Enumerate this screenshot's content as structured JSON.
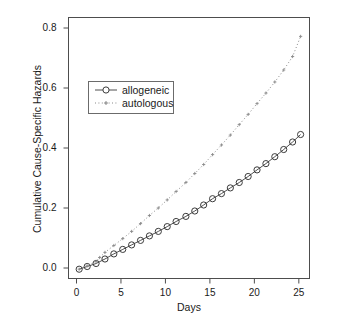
{
  "chart_data": {
    "type": "line",
    "title": "",
    "xlabel": "Days",
    "ylabel": "Cumulative Cause-Specific Hazards",
    "xlim": [
      -0.9,
      26.2
    ],
    "ylim": [
      -0.035,
      0.835
    ],
    "xticks": [
      0,
      5,
      10,
      15,
      20,
      25
    ],
    "xticklabels": [
      "0",
      "5",
      "10",
      "15",
      "20",
      "25"
    ],
    "yticks": [
      0.0,
      0.2,
      0.4,
      0.6,
      0.8
    ],
    "yticklabels": [
      "0.0",
      "0.2",
      "0.4",
      "0.6",
      "0.8"
    ],
    "grid": false,
    "legend_position": "upper-left-inset",
    "series": [
      {
        "name": "allogeneic",
        "marker": "open-circle",
        "linestyle": "solid",
        "color": "#3b3b3b",
        "x": [
          0.3,
          1.2,
          2.2,
          3.2,
          4.2,
          5.2,
          6.2,
          7.2,
          8.2,
          9.2,
          10.2,
          11.2,
          12.3,
          13.3,
          14.3,
          15.3,
          16.3,
          17.3,
          18.3,
          19.3,
          20.3,
          21.3,
          22.3,
          23.3,
          24.3,
          25.2
        ],
        "y": [
          -0.004,
          0.005,
          0.015,
          0.03,
          0.047,
          0.062,
          0.077,
          0.092,
          0.107,
          0.122,
          0.138,
          0.155,
          0.172,
          0.19,
          0.21,
          0.231,
          0.248,
          0.267,
          0.285,
          0.305,
          0.327,
          0.348,
          0.371,
          0.395,
          0.42,
          0.445
        ]
      },
      {
        "name": "autologous",
        "marker": "dot-plus",
        "linestyle": "dotted",
        "color": "#8a8a8a",
        "x": [
          0.3,
          1.2,
          2.2,
          2.6,
          3.2,
          4.2,
          5.2,
          6.2,
          7.2,
          8.2,
          9.2,
          10.2,
          11.2,
          12.3,
          13.3,
          14.3,
          15.3,
          16.3,
          17.3,
          18.3,
          19.3,
          20.3,
          21.3,
          22.3,
          23.3,
          24.3,
          25.2
        ],
        "y": [
          -0.004,
          0.007,
          0.022,
          0.035,
          0.052,
          0.075,
          0.098,
          0.122,
          0.148,
          0.175,
          0.2,
          0.227,
          0.255,
          0.285,
          0.315,
          0.345,
          0.378,
          0.41,
          0.443,
          0.478,
          0.512,
          0.548,
          0.583,
          0.62,
          0.66,
          0.705,
          0.772
        ]
      }
    ]
  },
  "legend": {
    "entries": [
      {
        "label": "allogeneic"
      },
      {
        "label": "autologous"
      }
    ]
  },
  "colors": {
    "axis": "#4d4d4d",
    "allogeneic": "#3b3b3b",
    "autologous": "#8a8a8a",
    "text": "#1a1a1a",
    "background": "#ffffff"
  }
}
